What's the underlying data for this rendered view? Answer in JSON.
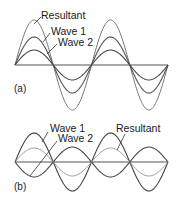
{
  "figure": {
    "panels": [
      {
        "id": "a",
        "label": "(a)",
        "description": "Constructive interference",
        "axis": {
          "x_start": 15,
          "x_end": 168,
          "y": 65
        },
        "cycles": 2,
        "waves": [
          {
            "name": "Resultant",
            "amplitude": 45,
            "phase": 1,
            "color": "#777777",
            "width": 1.0
          },
          {
            "name": "Wave 1",
            "amplitude": 28,
            "phase": 1,
            "color": "#555555",
            "width": 1.1
          },
          {
            "name": "Wave 2",
            "amplitude": 15,
            "phase": 1,
            "color": "#444444",
            "width": 1.1
          }
        ],
        "labels": [
          {
            "text": "Resultant",
            "x": 41,
            "y": 19,
            "leader": [
              41,
              17,
              34,
              24
            ]
          },
          {
            "text": "Wave 1",
            "x": 51,
            "y": 35,
            "leader": [
              50,
              33,
              43,
              42
            ]
          },
          {
            "text": "Wave 2",
            "x": 58,
            "y": 46,
            "leader": [
              57,
              44,
              47,
              54
            ]
          }
        ],
        "panel_label_pos": {
          "x": 14,
          "y": 92
        }
      },
      {
        "id": "b",
        "label": "(b)",
        "description": "Destructive interference",
        "axis": {
          "x_start": 15,
          "x_end": 168,
          "y": 162
        },
        "cycles": 2,
        "waves": [
          {
            "name": "Wave 1",
            "amplitude": 29,
            "phase": 1,
            "color": "#444444",
            "width": 1.1
          },
          {
            "name": "Wave 2",
            "amplitude": 15,
            "phase": -1,
            "color": "#444444",
            "width": 1.1
          },
          {
            "name": "Resultant",
            "amplitude": 14,
            "phase": 1,
            "color": "#999999",
            "width": 1.0
          }
        ],
        "labels": [
          {
            "text": "Wave 1",
            "x": 50,
            "y": 132,
            "leader": [
              48,
              132,
              42,
              142
            ]
          },
          {
            "text": "Wave 2",
            "x": 58,
            "y": 142,
            "leader": [
              57,
              141,
              30,
              176
            ]
          },
          {
            "text": "Resultant",
            "x": 116,
            "y": 132,
            "leader": [
              125,
              134,
              117,
              150
            ]
          }
        ],
        "panel_label_pos": {
          "x": 14,
          "y": 190
        }
      }
    ]
  }
}
